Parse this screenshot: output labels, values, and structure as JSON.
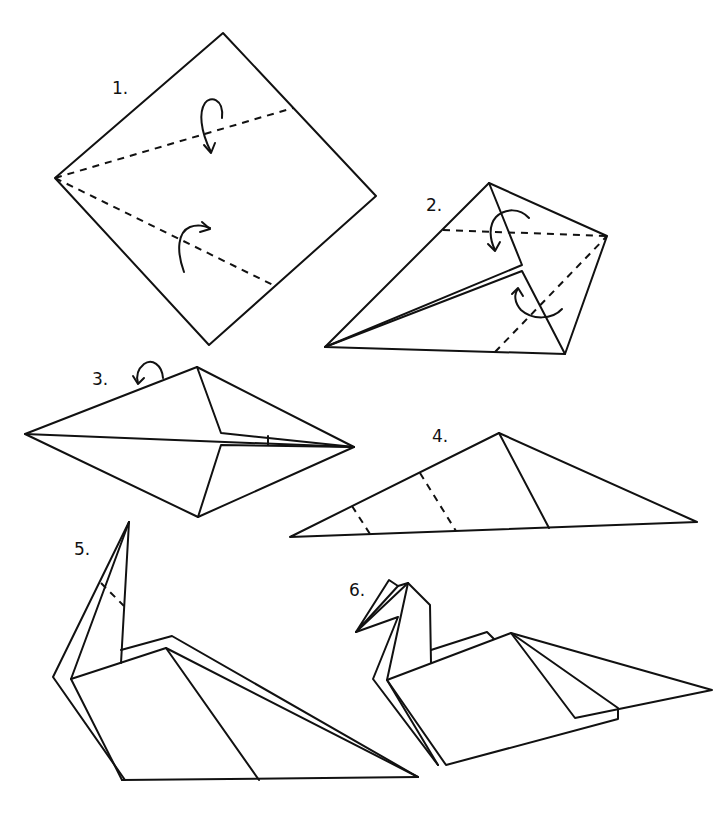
{
  "colors": {
    "ink": "#111111",
    "background": "#ffffff"
  },
  "steps": [
    {
      "number": "1.",
      "description": "Square turned as diamond; fold two edges to center along dashed valley lines",
      "fold_arrows": 2,
      "dashed_lines": 2
    },
    {
      "number": "2.",
      "description": "Kite shape; fold flaps along dashed lines as shown by arrows",
      "fold_arrows": 2,
      "dashed_lines": 2
    },
    {
      "number": "3.",
      "description": "Diamond with folded flaps; turn over",
      "fold_arrows": 1,
      "dashed_lines": 0
    },
    {
      "number": "4.",
      "description": "Folded in half into a triangle; fold neck and head along dashed lines",
      "fold_arrows": 0,
      "dashed_lines": 2
    },
    {
      "number": "5.",
      "description": "Neck raised; fold head down along dashed line",
      "fold_arrows": 0,
      "dashed_lines": 1
    },
    {
      "number": "6.",
      "description": "Finished swan",
      "fold_arrows": 0,
      "dashed_lines": 0
    }
  ]
}
